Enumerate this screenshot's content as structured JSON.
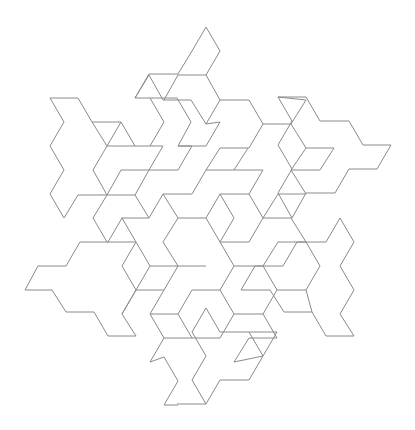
{
  "figure": {
    "width": 415,
    "height": 430,
    "background": "#ffffff",
    "stroke_color": "#8a8a8a",
    "stroke_width": 1,
    "polylines": [
      [
        [
          206,
          27
        ],
        [
          220,
          51
        ],
        [
          206,
          75
        ],
        [
          220,
          100
        ],
        [
          206,
          124
        ],
        [
          191,
          100
        ],
        [
          163,
          100
        ],
        [
          149,
          75
        ],
        [
          135,
          98
        ],
        [
          177,
          98
        ]
      ],
      [
        [
          135,
          98
        ],
        [
          149,
          74
        ],
        [
          178,
          74
        ],
        [
          192,
          51
        ],
        [
          206,
          27
        ]
      ],
      [
        [
          50,
          98
        ],
        [
          78,
          98
        ],
        [
          92,
          122
        ],
        [
          121,
          122
        ],
        [
          135,
          146
        ],
        [
          163,
          146
        ],
        [
          149,
          170
        ],
        [
          121,
          170
        ],
        [
          107,
          195
        ],
        [
          78,
          195
        ],
        [
          64,
          218
        ]
      ],
      [
        [
          50,
          98
        ],
        [
          64,
          122
        ],
        [
          50,
          146
        ],
        [
          64,
          170
        ],
        [
          50,
          194
        ],
        [
          64,
          218
        ]
      ],
      [
        [
          278,
          97
        ],
        [
          306,
          97
        ],
        [
          320,
          121
        ],
        [
          349,
          121
        ],
        [
          363,
          145
        ],
        [
          391,
          145
        ],
        [
          377,
          169
        ],
        [
          349,
          169
        ],
        [
          335,
          193
        ],
        [
          306,
          193
        ],
        [
          292,
          218
        ]
      ],
      [
        [
          278,
          97
        ],
        [
          292,
          121
        ],
        [
          278,
          145
        ],
        [
          292,
          169
        ],
        [
          278,
          193
        ],
        [
          292,
          218
        ]
      ],
      [
        [
          25,
          290
        ],
        [
          38,
          266
        ],
        [
          66,
          266
        ],
        [
          80,
          242
        ],
        [
          108,
          242
        ],
        [
          122,
          218
        ],
        [
          136,
          242
        ],
        [
          122,
          266
        ],
        [
          136,
          290
        ],
        [
          122,
          314
        ],
        [
          136,
          336
        ],
        [
          108,
          336
        ],
        [
          94,
          312
        ],
        [
          66,
          312
        ],
        [
          52,
          290
        ],
        [
          25,
          290
        ]
      ],
      [
        [
          340,
          218
        ],
        [
          354,
          242
        ],
        [
          340,
          266
        ],
        [
          354,
          290
        ],
        [
          340,
          314
        ],
        [
          354,
          336
        ],
        [
          326,
          336
        ],
        [
          312,
          312
        ],
        [
          284,
          312
        ],
        [
          270,
          290
        ],
        [
          241,
          290
        ],
        [
          255,
          266
        ],
        [
          283,
          266
        ],
        [
          297,
          242
        ],
        [
          326,
          242
        ],
        [
          340,
          218
        ]
      ],
      [
        [
          206,
          404
        ],
        [
          192,
          380
        ],
        [
          206,
          356
        ],
        [
          192,
          332
        ],
        [
          206,
          308
        ],
        [
          220,
          332
        ],
        [
          249,
          332
        ],
        [
          263,
          356
        ],
        [
          277,
          332
        ],
        [
          249,
          332
        ]
      ],
      [
        [
          177,
          404
        ],
        [
          206,
          404
        ]
      ],
      [
        [
          206,
          404
        ],
        [
          220,
          380
        ],
        [
          249,
          380
        ],
        [
          263,
          356
        ]
      ],
      [
        [
          164,
          357
        ],
        [
          178,
          381
        ],
        [
          164,
          405
        ],
        [
          178,
          405
        ]
      ],
      [
        [
          150,
          98
        ],
        [
          164,
          122
        ],
        [
          150,
          146
        ]
      ],
      [
        [
          177,
          98
        ],
        [
          191,
          122
        ],
        [
          178,
          146
        ],
        [
          206,
          146
        ],
        [
          220,
          122
        ],
        [
          206,
          124
        ]
      ],
      [
        [
          121,
          122
        ],
        [
          107,
          146
        ],
        [
          135,
          146
        ]
      ],
      [
        [
          220,
          100
        ],
        [
          249,
          100
        ],
        [
          263,
          124
        ],
        [
          291,
          124
        ],
        [
          306,
          100
        ],
        [
          278,
          97
        ]
      ],
      [
        [
          263,
          124
        ],
        [
          249,
          148
        ],
        [
          220,
          148
        ],
        [
          206,
          170
        ],
        [
          234,
          170
        ],
        [
          248,
          148
        ]
      ],
      [
        [
          291,
          124
        ],
        [
          306,
          148
        ],
        [
          291,
          170
        ],
        [
          306,
          194
        ]
      ],
      [
        [
          306,
          148
        ],
        [
          334,
          148
        ],
        [
          320,
          170
        ],
        [
          292,
          170
        ]
      ],
      [
        [
          93,
          170
        ],
        [
          107,
          195
        ],
        [
          93,
          218
        ],
        [
          107,
          242
        ],
        [
          135,
          242
        ]
      ],
      [
        [
          107,
          195
        ],
        [
          135,
          195
        ],
        [
          149,
          218
        ],
        [
          121,
          218
        ]
      ],
      [
        [
          135,
          195
        ],
        [
          149,
          170
        ],
        [
          178,
          170
        ],
        [
          192,
          146
        ],
        [
          178,
          146
        ]
      ],
      [
        [
          149,
          218
        ],
        [
          163,
          194
        ],
        [
          192,
          194
        ],
        [
          206,
          170
        ]
      ],
      [
        [
          163,
          194
        ],
        [
          178,
          218
        ],
        [
          163,
          242
        ],
        [
          178,
          266
        ],
        [
          206,
          266
        ]
      ],
      [
        [
          178,
          218
        ],
        [
          206,
          218
        ],
        [
          220,
          194
        ],
        [
          249,
          194
        ],
        [
          263,
          170
        ],
        [
          234,
          170
        ]
      ],
      [
        [
          220,
          194
        ],
        [
          234,
          218
        ],
        [
          220,
          242
        ],
        [
          249,
          242
        ],
        [
          263,
          218
        ],
        [
          249,
          194
        ]
      ],
      [
        [
          263,
          218
        ],
        [
          278,
          194
        ],
        [
          306,
          194
        ]
      ],
      [
        [
          263,
          218
        ],
        [
          291,
          218
        ],
        [
          306,
          242
        ],
        [
          278,
          242
        ],
        [
          263,
          266
        ],
        [
          234,
          266
        ],
        [
          220,
          242
        ]
      ],
      [
        [
          206,
          218
        ],
        [
          220,
          242
        ]
      ],
      [
        [
          136,
          242
        ],
        [
          150,
          266
        ],
        [
          136,
          290
        ],
        [
          164,
          290
        ],
        [
          178,
          266
        ]
      ],
      [
        [
          150,
          266
        ],
        [
          178,
          266
        ]
      ],
      [
        [
          164,
          290
        ],
        [
          150,
          314
        ],
        [
          178,
          314
        ],
        [
          192,
          290
        ],
        [
          220,
          290
        ],
        [
          234,
          266
        ]
      ],
      [
        [
          178,
          314
        ],
        [
          192,
          338
        ],
        [
          220,
          338
        ],
        [
          234,
          314
        ],
        [
          263,
          314
        ],
        [
          277,
          290
        ],
        [
          263,
          266
        ]
      ],
      [
        [
          234,
          314
        ],
        [
          220,
          290
        ]
      ],
      [
        [
          136,
          290
        ],
        [
          122,
          314
        ]
      ],
      [
        [
          150,
          314
        ],
        [
          164,
          338
        ],
        [
          150,
          362
        ],
        [
          164,
          357
        ]
      ],
      [
        [
          164,
          338
        ],
        [
          192,
          338
        ]
      ],
      [
        [
          277,
          290
        ],
        [
          306,
          290
        ],
        [
          320,
          266
        ],
        [
          306,
          242
        ]
      ],
      [
        [
          263,
          314
        ],
        [
          277,
          338
        ],
        [
          249,
          338
        ],
        [
          234,
          362
        ],
        [
          263,
          356
        ]
      ],
      [
        [
          306,
          290
        ],
        [
          312,
          312
        ]
      ],
      [
        [
          92,
          122
        ],
        [
          107,
          146
        ],
        [
          93,
          170
        ]
      ],
      [
        [
          206,
          75
        ],
        [
          178,
          75
        ],
        [
          164,
          100
        ]
      ]
    ]
  }
}
